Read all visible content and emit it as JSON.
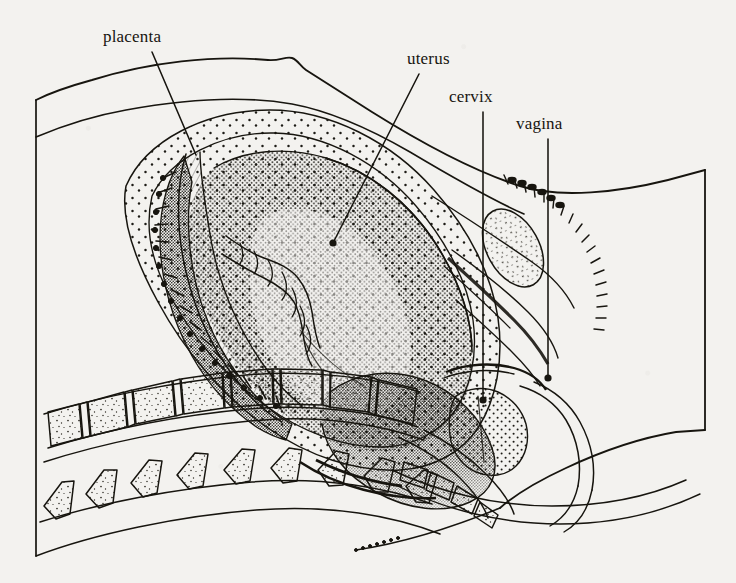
{
  "figure": {
    "kind": "anatomical-line-drawing",
    "background_color": "#f3f2ef",
    "ink_color": "#17150f",
    "width": 736,
    "height": 583
  },
  "labels": [
    {
      "id": "placenta",
      "text": "placenta",
      "x": 103,
      "y": 28,
      "leader": {
        "from": [
          152,
          52
        ],
        "to": [
          196,
          155
        ],
        "endpoint": "line"
      }
    },
    {
      "id": "uterus",
      "text": "uterus",
      "x": 407,
      "y": 50,
      "leader": {
        "from": [
          419,
          74
        ],
        "to": [
          333,
          243
        ],
        "endpoint": "dot"
      }
    },
    {
      "id": "cervix",
      "text": "cervix",
      "x": 449,
      "y": 88,
      "leader": {
        "from": [
          483,
          112
        ],
        "to": [
          483,
          400
        ],
        "endpoint": "dot"
      }
    },
    {
      "id": "vagina",
      "text": "vagina",
      "x": 516,
      "y": 115,
      "leader": {
        "from": [
          548,
          139
        ],
        "to": [
          548,
          378
        ],
        "endpoint": "dot"
      }
    }
  ],
  "structures": [
    {
      "id": "maternal-body-outline",
      "name": "maternal body outline",
      "note": "torso contour with abdominal wall, navel bump near x=290, right shoulder corner near x=705 y=430"
    },
    {
      "id": "uterine-wall",
      "name": "uterine wall",
      "note": "stippled band enclosing amniotic cavity"
    },
    {
      "id": "amniotic-cavity",
      "name": "amniotic cavity",
      "note": "light stippled zone between uterine wall and fetus"
    },
    {
      "id": "placenta-body",
      "name": "placenta",
      "note": "dark villous cotyledon mass on anterior-superior uterine wall"
    },
    {
      "id": "umbilical-cord",
      "name": "umbilical cord",
      "note": "helically twisted cord from placenta toward fetal abdomen"
    },
    {
      "id": "fetus",
      "name": "fetus",
      "note": "densely stippled fetal body, vertex presentation, head in pelvis"
    },
    {
      "id": "fetal-head",
      "name": "fetal head",
      "note": "engaged in maternal pelvis above cervix"
    },
    {
      "id": "cervix-body",
      "name": "cervix",
      "note": "stippled cervical canal at lower uterine segment"
    },
    {
      "id": "vaginal-canal",
      "name": "vagina",
      "note": "canal below cervix continuing to perineum"
    },
    {
      "id": "pubic-symphysis",
      "name": "pubic symphysis",
      "note": "stippled oval bone anterior to bladder region"
    },
    {
      "id": "lumbar-vertebrae",
      "name": "lumbar vertebrae",
      "note": "row of 8 stippled vertebral bodies with intervertebral discs"
    },
    {
      "id": "spinous-processes",
      "name": "spinous processes",
      "note": "row of 9 tapered stippled processes posterior to vertebral bodies"
    },
    {
      "id": "sacrum-coccyx",
      "name": "sacrum and coccyx",
      "note": "tapering segmented bone curving to lower right"
    },
    {
      "id": "spinal-canal",
      "name": "spinal canal",
      "note": "band between vertebral bodies and spinous processes"
    },
    {
      "id": "perineum",
      "name": "perineum",
      "note": "long curve toward lower right with dotted continuation"
    },
    {
      "id": "frame-line-left",
      "name": "left frame line",
      "note": "vertical border at x=36 from y=100 to y=556"
    }
  ]
}
